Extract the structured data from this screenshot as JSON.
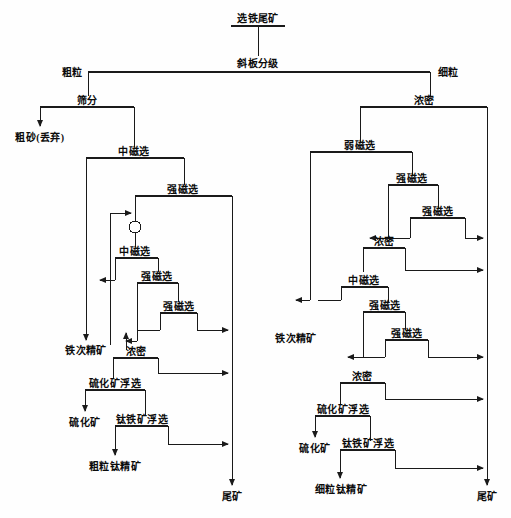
{
  "diagram": {
    "type": "mineral-processing-flowsheet",
    "language": "zh-CN",
    "stroke_color": "#1a1a1a",
    "background_color": "#fefefe",
    "feed": "选铁尾矿",
    "classifier": "斜板分级",
    "stream_labels": {
      "coarse": "粗粒",
      "fine": "细粒"
    },
    "left_branch": {
      "name": "粗粒",
      "nodes": [
        {
          "id": "l-screen",
          "label": "筛分"
        },
        {
          "id": "l-midmag-1",
          "label": "中磁选"
        },
        {
          "id": "l-highmag-1",
          "label": "强磁选"
        },
        {
          "id": "l-midmag-2",
          "label": "中磁选"
        },
        {
          "id": "l-highmag-2",
          "label": "强磁选"
        },
        {
          "id": "l-highmag-3",
          "label": "强磁选"
        },
        {
          "id": "l-thicken",
          "label": "浓密"
        },
        {
          "id": "l-sulf-flot",
          "label": "硫化矿浮选"
        },
        {
          "id": "l-ti-flot",
          "label": "钛铁矿浮选"
        }
      ],
      "products": [
        {
          "id": "l-coarse-sand",
          "label": "粗砂(丢弃)"
        },
        {
          "id": "l-fe-second",
          "label": "铁次精矿"
        },
        {
          "id": "l-sulfide",
          "label": "硫化矿"
        },
        {
          "id": "l-ti-conc",
          "label": "粗粒钛精矿"
        },
        {
          "id": "l-tailings",
          "label": "尾矿"
        }
      ]
    },
    "right_branch": {
      "name": "细粒",
      "nodes": [
        {
          "id": "r-thicken-1",
          "label": "浓密"
        },
        {
          "id": "r-lowmag",
          "label": "弱磁选"
        },
        {
          "id": "r-highmag-1",
          "label": "强磁选"
        },
        {
          "id": "r-highmag-2",
          "label": "强磁选"
        },
        {
          "id": "r-thicken-2",
          "label": "浓密"
        },
        {
          "id": "r-midmag",
          "label": "中磁选"
        },
        {
          "id": "r-highmag-3",
          "label": "强磁选"
        },
        {
          "id": "r-highmag-4",
          "label": "强磁选"
        },
        {
          "id": "r-thicken-3",
          "label": "浓密"
        },
        {
          "id": "r-sulf-flot",
          "label": "硫化矿浮选"
        },
        {
          "id": "r-ti-flot",
          "label": "钛铁矿浮选"
        }
      ],
      "products": [
        {
          "id": "r-fe-second",
          "label": "铁次精矿"
        },
        {
          "id": "r-sulfide",
          "label": "硫化矿"
        },
        {
          "id": "r-ti-conc",
          "label": "细粒钛精矿"
        },
        {
          "id": "r-tailings",
          "label": "尾矿"
        }
      ]
    },
    "symbols": [
      {
        "id": "pump-circle",
        "shape": "circle",
        "label": ""
      }
    ]
  }
}
